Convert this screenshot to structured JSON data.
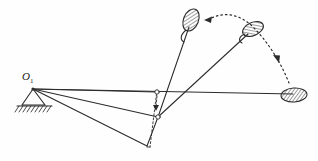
{
  "figure": {
    "background_color": "#fefefe",
    "ink_color": "#2b2b2b",
    "labels": [
      {
        "id": "pivot",
        "text": "O",
        "subscript": "1",
        "x": 22,
        "y": 70
      }
    ],
    "ground_support": {
      "name": "fixed-pivot-ground",
      "pivot_x": 33,
      "pivot_y": 89,
      "triangle": "33,89 22,105 45,105",
      "hatch_line": {
        "x1": 17,
        "y1": 106,
        "x2": 52,
        "y2": 106
      },
      "hatch_count": 9
    },
    "rays_from_pivot": [
      {
        "name": "ray-horizontal-to-ball",
        "x1": 33,
        "y1": 89,
        "x2": 293,
        "y2": 94
      },
      {
        "name": "ray-to-node-upper",
        "x1": 33,
        "y1": 89,
        "x2": 157,
        "y2": 92
      },
      {
        "name": "ray-to-node-mid",
        "x1": 33,
        "y1": 89,
        "x2": 158,
        "y2": 117
      },
      {
        "name": "ray-to-node-lower",
        "x1": 33,
        "y1": 89,
        "x2": 147,
        "y2": 146
      }
    ],
    "connector_links": [
      {
        "name": "link-node-lower-to-mid",
        "x1": 147,
        "y1": 146,
        "x2": 158,
        "y2": 117
      },
      {
        "name": "link-node-mid-to-paddle-b",
        "x1": 158,
        "y1": 117,
        "x2": 248,
        "y2": 33
      },
      {
        "name": "link-node-mid-to-paddle-a",
        "x1": 158,
        "y1": 117,
        "x2": 190,
        "y2": 26
      }
    ],
    "vertical_dashed_axis": {
      "name": "vertical-dashed-axis",
      "x": 157,
      "y_top": 90,
      "y_bottom": 147,
      "dash": "2,2"
    },
    "axis_nodes": [
      {
        "name": "node-upper",
        "cx": 157,
        "cy": 92,
        "r": 2.2
      },
      {
        "name": "node-mid",
        "cx": 158,
        "cy": 117,
        "r": 2.2
      },
      {
        "name": "node-arrow-tip",
        "cx": 157,
        "cy": 108,
        "r": 0
      }
    ],
    "paddles": [
      {
        "name": "paddle-position-a",
        "cx": 191,
        "cy": 20,
        "rx": 7.5,
        "ry": 11.5,
        "rotation": 22,
        "hatch": true,
        "handle": "M 186,30 C 181,35 181,39 184,41"
      },
      {
        "name": "paddle-position-b",
        "cx": 253,
        "cy": 29,
        "rx": 11,
        "ry": 6.5,
        "rotation": -22,
        "hatch": true,
        "handle": "M 244,34 C 239,36 239,40 242,41"
      },
      {
        "name": "paddle-position-c",
        "cx": 294,
        "cy": 95,
        "rx": 13,
        "ry": 7,
        "rotation": -4,
        "hatch": true,
        "handle": null
      }
    ],
    "trajectory_arc": {
      "name": "swing-trajectory-arc",
      "style": "dotted",
      "path": "M 206,20 C 222,10 240,14 252,26 C 268,42 280,62 288,82",
      "dash": "1.6,3",
      "arrowheads": [
        {
          "name": "arrow-to-paddle-a",
          "x": 205,
          "y": 20,
          "angle": 200
        },
        {
          "name": "arrow-midspan",
          "x": 275,
          "y": 58,
          "angle": 66
        }
      ]
    },
    "vertical_arrow": {
      "name": "downward-indicator-arrow",
      "x": 157,
      "y_from": 95,
      "y_to": 110
    }
  }
}
